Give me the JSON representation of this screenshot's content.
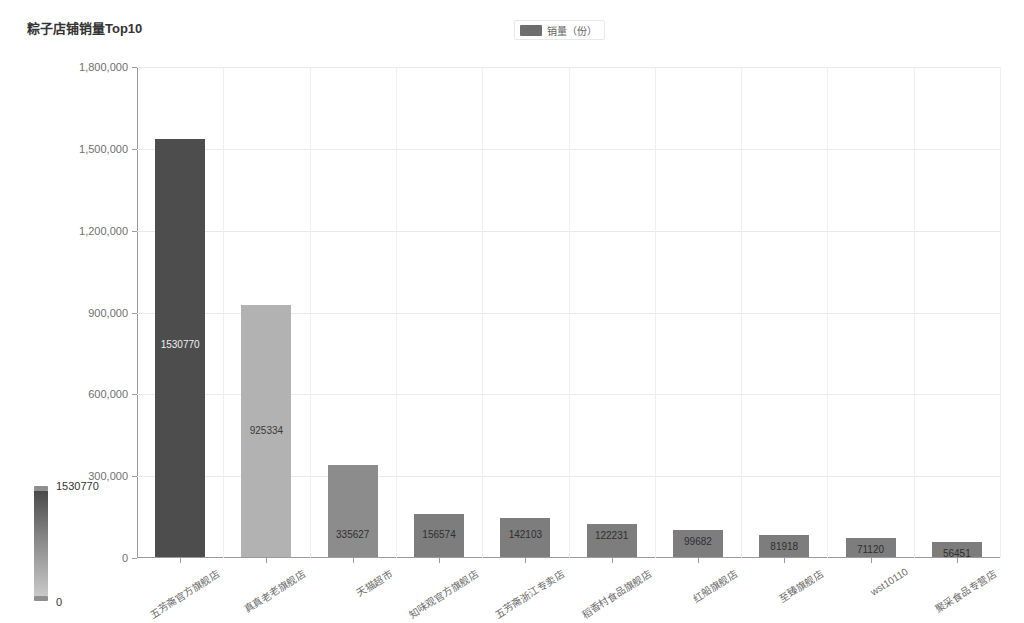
{
  "header": {
    "title": "粽子店铺销量Top10"
  },
  "legend": {
    "items": [
      {
        "label": "销量（份）",
        "color": "#6e6e6e",
        "icon": "legend-swatch"
      }
    ]
  },
  "visual_map": {
    "max_label": "1530770",
    "min_label": "0",
    "gradient_top_color": "#4a4a4a",
    "gradient_bottom_color": "#c9c9c9"
  },
  "chart_data": {
    "type": "bar",
    "title": "粽子店铺销量Top10",
    "xlabel": "",
    "ylabel": "",
    "ylim": [
      0,
      1800000
    ],
    "grid": true,
    "legend_position": "top-center",
    "series_name": "销量（份）",
    "y_ticks": [
      "0",
      "300,000",
      "600,000",
      "900,000",
      "1,200,000",
      "1,500,000",
      "1,800,000"
    ],
    "y_tick_values": [
      0,
      300000,
      600000,
      900000,
      1200000,
      1500000,
      1800000
    ],
    "categories": [
      "五芳斋官方旗舰店",
      "真真老老旗舰店",
      "天猫超市",
      "知味观官方旗舰店",
      "五芳斋浙江专卖店",
      "稻香村食品旗舰店",
      "红船旗舰店",
      "至臻旗舰店",
      "wst10110",
      "聚采食品专营店"
    ],
    "values": [
      1530770,
      925334,
      335627,
      156574,
      142103,
      122231,
      99682,
      81918,
      71120,
      56451
    ],
    "value_labels": [
      "1530770",
      "925334",
      "335627",
      "156574",
      "142103",
      "122231",
      "99682",
      "81918",
      "71120",
      "56451"
    ],
    "bar_colors": [
      "#4d4d4d",
      "#b2b2b2",
      "#8c8c8c",
      "#7d7d7d",
      "#7d7d7d",
      "#7d7d7d",
      "#7d7d7d",
      "#7d7d7d",
      "#7d7d7d",
      "#7d7d7d"
    ]
  }
}
